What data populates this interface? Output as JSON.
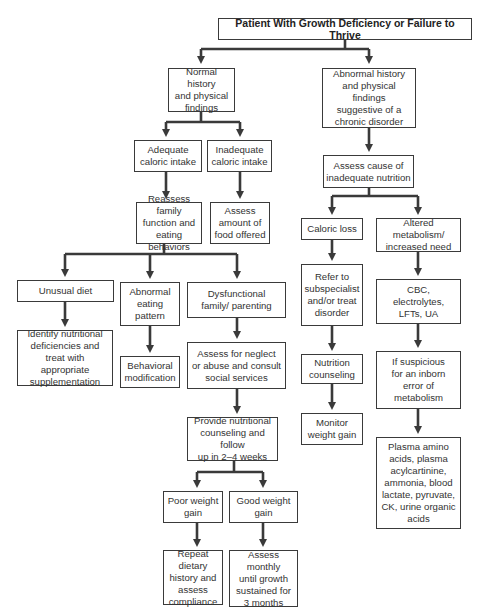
{
  "title": "Patient With Growth Deficiency or Failure to Thrive",
  "nodes": {
    "normal_history": "Normal history\nand physical\nfindings",
    "abnormal_history": "Abnormal history\nand physical findings\nsuggestive of a\nchronic disorder",
    "adequate_intake": "Adequate\ncaloric intake",
    "inadequate_intake": "Inadequate\ncaloric intake",
    "reassess_family": "Reassess family\nfunction and\neating behaviors",
    "assess_amount": "Assess\namount of\nfood offered",
    "assess_cause": "Assess cause of\ninadequate nutrition",
    "caloric_loss": "Caloric loss",
    "altered_metabolism": "Altered metabolism/\nincreased need",
    "unusual_diet": "Unusual diet",
    "abnormal_eating": "Abnormal\neating\npattern",
    "dysfunctional_family": "Dysfunctional\nfamily/ parenting",
    "identify_deficiencies": "Identify nutritional\ndeficiencies and\ntreat with appropriate\nsupplementation",
    "behavioral_modification": "Behavioral\nmodification",
    "assess_neglect": "Assess for neglect\nor abuse and consult\nsocial services",
    "refer_subspecialist": "Refer to\nsubspecialist\nand/or treat\ndisorder",
    "cbc_labs": "CBC,\nelectrolytes,\nLFTs, UA",
    "nutrition_counseling": "Nutrition\ncounseling",
    "if_suspicious": "If suspicious\nfor an inborn\nerror of\nmetabolism",
    "monitor_weight": "Monitor\nweight gain",
    "plasma_tests": "Plasma amino\nacids, plasma\nacylcartinine,\nammonia, blood\nlactate, pyruvate,\nCK, urine organic\nacids",
    "provide_counseling": "Provide nutritional\ncounseling and follow\nup in 2–4 weeks",
    "poor_weight_gain": "Poor weight\ngain",
    "good_weight_gain": "Good weight\ngain",
    "repeat_history": "Repeat dietary\nhistory and\nassess\ncompliance",
    "assess_monthly": "Assess monthly\nuntil growth\nsustained for\n3 months"
  },
  "colors": {
    "line": "#3a3a3a",
    "border": "#3a3a3a",
    "text": "#333333",
    "background": "#ffffff"
  }
}
